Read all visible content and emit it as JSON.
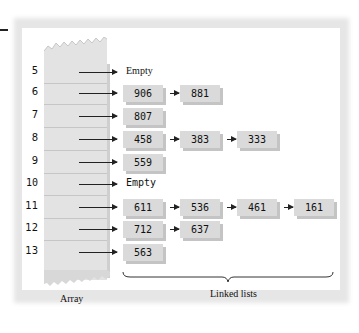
{
  "diagram": {
    "type": "hash-table-separate-chaining",
    "array_label": "Array",
    "lists_label": "Linked lists",
    "empty_label": "Empty",
    "rows": [
      {
        "index": "5",
        "y": 72,
        "empty": true,
        "empty_text": "Empty",
        "nodes": []
      },
      {
        "index": "6",
        "y": 93,
        "empty": false,
        "nodes": [
          "906",
          "881"
        ]
      },
      {
        "index": "7",
        "y": 116,
        "empty": false,
        "nodes": [
          "807"
        ]
      },
      {
        "index": "8",
        "y": 139,
        "empty": false,
        "nodes": [
          "458",
          "383",
          "333"
        ]
      },
      {
        "index": "9",
        "y": 162,
        "empty": false,
        "nodes": [
          "559"
        ]
      },
      {
        "index": "10",
        "y": 184,
        "empty": true,
        "empty_text": "Empty",
        "nodes": []
      },
      {
        "index": "11",
        "y": 207,
        "empty": false,
        "nodes": [
          "611",
          "536",
          "461",
          "161"
        ]
      },
      {
        "index": "12",
        "y": 229,
        "empty": false,
        "nodes": [
          "712",
          "637"
        ]
      },
      {
        "index": "13",
        "y": 252,
        "empty": false,
        "nodes": [
          "563"
        ]
      }
    ]
  },
  "colors": {
    "node_fill": "#dadada",
    "node_shadow": "#c4c4c4",
    "array_fill": "#e3e3e3",
    "arrow": "#222222",
    "frame_shadow": "#e6e6e6"
  }
}
